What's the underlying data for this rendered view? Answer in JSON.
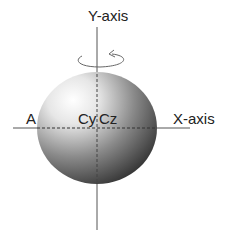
{
  "diagram": {
    "labels": {
      "y_axis": "Y-axis",
      "x_axis": "X-axis",
      "point_a": "A",
      "center_cy": "Cy",
      "center_cz": "Cz"
    },
    "colors": {
      "line": "#555555",
      "sphere_light": "#ffffff",
      "sphere_dark": "#2a2a2a"
    },
    "rotation_indicator": "rotation-arrow-around-y-axis"
  }
}
